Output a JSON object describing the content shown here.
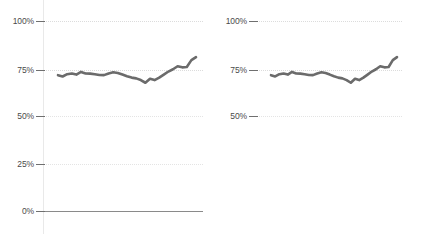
{
  "chart_data": [
    {
      "panel": "left",
      "type": "line",
      "title": "",
      "xlabel": "",
      "ylabel": "",
      "ylim": [
        0,
        100
      ],
      "xlim": [
        0,
        30
      ],
      "grid": true,
      "legend": null,
      "yticks": [
        0,
        25,
        50,
        75,
        100
      ],
      "ytick_labels": [
        "0%",
        "25%",
        "50%",
        "75%",
        "100%"
      ],
      "series": [
        {
          "name": "value",
          "color": "#6b6b6b",
          "x": [
            0,
            1,
            2,
            3,
            4,
            5,
            6,
            7,
            8,
            9,
            10,
            11,
            12,
            13,
            14,
            15,
            16,
            17,
            18,
            19,
            20,
            21,
            22,
            23,
            24,
            25,
            26,
            27,
            28,
            29,
            30
          ],
          "values": [
            71.5,
            70.8,
            72.0,
            72.4,
            71.8,
            73.2,
            72.4,
            72.3,
            72.0,
            71.6,
            71.5,
            72.4,
            73.0,
            72.6,
            71.8,
            70.9,
            70.2,
            69.8,
            68.9,
            67.5,
            69.6,
            68.9,
            70.2,
            71.8,
            73.4,
            74.6,
            76.2,
            75.6,
            75.8,
            79.4,
            81.0
          ]
        }
      ]
    },
    {
      "panel": "right",
      "type": "line",
      "title": "",
      "xlabel": "",
      "ylabel": "",
      "ylim": [
        41,
        105
      ],
      "xlim": [
        0,
        30
      ],
      "grid": true,
      "legend": null,
      "yticks": [
        50,
        75,
        100
      ],
      "ytick_labels": [
        "50%",
        "75%",
        "100%"
      ],
      "series": [
        {
          "name": "value",
          "color": "#6b6b6b",
          "x": [
            0,
            1,
            2,
            3,
            4,
            5,
            6,
            7,
            8,
            9,
            10,
            11,
            12,
            13,
            14,
            15,
            16,
            17,
            18,
            19,
            20,
            21,
            22,
            23,
            24,
            25,
            26,
            27,
            28,
            29,
            30
          ],
          "values": [
            71.5,
            70.8,
            72.0,
            72.4,
            71.8,
            73.2,
            72.4,
            72.3,
            72.0,
            71.6,
            71.5,
            72.4,
            73.0,
            72.6,
            71.8,
            70.9,
            70.2,
            69.8,
            68.9,
            67.5,
            69.6,
            68.9,
            70.2,
            71.8,
            73.4,
            74.6,
            76.2,
            75.6,
            75.8,
            79.4,
            81.0
          ]
        }
      ]
    }
  ],
  "left_chart": {
    "ticks": [
      {
        "label": "100%",
        "value": 100
      },
      {
        "label": "75%",
        "value": 75
      },
      {
        "label": "50%",
        "value": 50
      },
      {
        "label": "25%",
        "value": 25
      },
      {
        "label": "0%",
        "value": 0
      }
    ]
  },
  "right_chart": {
    "ticks": [
      {
        "label": "100%",
        "value": 100
      },
      {
        "label": "75%",
        "value": 75
      },
      {
        "label": "50%",
        "value": 50
      }
    ]
  },
  "colors": {
    "line": "#6b6b6b",
    "grid": "#dcdcdc",
    "axis": "#8a8a8a",
    "tick_text": "#4a4a4a"
  }
}
